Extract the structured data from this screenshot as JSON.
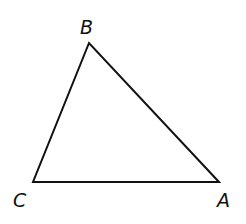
{
  "diagram": {
    "type": "triangle",
    "stroke_color": "#111111",
    "background": "#ffffff",
    "vertices": [
      {
        "name": "A",
        "label": "A",
        "x": 219,
        "y": 182,
        "label_x": 217,
        "label_y": 207
      },
      {
        "name": "B",
        "label": "B",
        "x": 89,
        "y": 43,
        "label_x": 80,
        "label_y": 34
      },
      {
        "name": "C",
        "label": "C",
        "x": 33,
        "y": 182,
        "label_x": 13,
        "label_y": 207
      }
    ],
    "sides": [
      {
        "from": "C",
        "to": "A"
      },
      {
        "from": "A",
        "to": "B"
      },
      {
        "from": "B",
        "to": "C"
      }
    ]
  }
}
